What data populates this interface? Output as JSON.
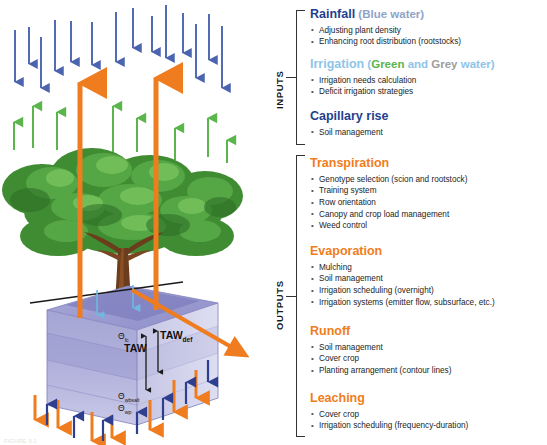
{
  "figure": {
    "caption": "FIGURE 3.1"
  },
  "axis": {
    "inputs": "INPUTS",
    "outputs": "OUTPUTS"
  },
  "colors": {
    "navy": "#1f3f8f",
    "blue_grey": "#8fa3c8",
    "light_blue": "#8fc4e8",
    "green": "#5ab54a",
    "grey": "#9d9d9d",
    "orange": "#f07d1e",
    "rain_arrow": "#4a64b0",
    "canopy_arrow": "#5ab54a",
    "soil_box": "#9a9ad0"
  },
  "diagram": {
    "labels": {
      "taw": "TAW",
      "taw_def_main": "TAW",
      "taw_def_sub": "def",
      "theta_fc_symbol": "Θ",
      "theta_fc_sub": "fc",
      "theta_wbsalt_symbol": "Θ",
      "theta_wbsalt_sub": "wbsalt",
      "theta_wp_symbol": "Θ",
      "theta_wp_sub": "wp"
    }
  },
  "sections": [
    {
      "id": "rainfall",
      "group": "inputs",
      "top": 8,
      "title_parts": [
        {
          "text": "Rainfall",
          "color_class": "c-navy",
          "size": "main"
        },
        {
          "text": " (Blue water)",
          "color_class": "c-bluegrey",
          "size": "sub"
        }
      ],
      "bullets": [
        "Adjusting plant density",
        "Enhancing root distribution (rootstocks)"
      ]
    },
    {
      "id": "irrigation",
      "group": "inputs",
      "top": 58,
      "title_parts": [
        {
          "text": "Irrigation",
          "color_class": "c-lightblue",
          "size": "main"
        },
        {
          "text": " (",
          "color_class": "c-lightblue",
          "size": "sub"
        },
        {
          "text": "Green",
          "color_class": "c-green",
          "size": "sub"
        },
        {
          "text": " and ",
          "color_class": "c-lightblue",
          "size": "sub"
        },
        {
          "text": "Grey",
          "color_class": "c-grey",
          "size": "sub"
        },
        {
          "text": " water)",
          "color_class": "c-lightblue",
          "size": "sub"
        }
      ],
      "bullets": [
        "Irrigation needs calculation",
        "Deficit irrigation strategies"
      ]
    },
    {
      "id": "capillary-rise",
      "group": "inputs",
      "top": 110,
      "title_parts": [
        {
          "text": "Capillary rise",
          "color_class": "c-navy",
          "size": "main"
        }
      ],
      "bullets": [
        "Soil management"
      ]
    },
    {
      "id": "transpiration",
      "group": "outputs",
      "top": 157,
      "title_parts": [
        {
          "text": "Transpiration",
          "color_class": "c-orange",
          "size": "main"
        }
      ],
      "bullets": [
        "Genotype selection (scion and rootstock)",
        "Training system",
        "Row orientation",
        "Canopy and crop load management",
        "Weed control"
      ]
    },
    {
      "id": "evaporation",
      "group": "outputs",
      "top": 245,
      "title_parts": [
        {
          "text": "Evaporation",
          "color_class": "c-orange",
          "size": "main"
        }
      ],
      "bullets": [
        "Mulching",
        "Soil management",
        "Irrigation scheduling (overnight)",
        "Irrigation systems (emitter flow, subsurface, etc.)"
      ]
    },
    {
      "id": "runoff",
      "group": "outputs",
      "top": 325,
      "title_parts": [
        {
          "text": "Runoff",
          "color_class": "c-orange",
          "size": "main"
        }
      ],
      "bullets": [
        "Soil management",
        "Cover crop",
        "Planting arrangement (contour lines)"
      ]
    },
    {
      "id": "leaching",
      "group": "outputs",
      "top": 392,
      "title_parts": [
        {
          "text": "Leaching",
          "color_class": "c-orange",
          "size": "main"
        }
      ],
      "bullets": [
        "Cover crop",
        "Irrigation scheduling (frequency-duration)"
      ]
    }
  ]
}
